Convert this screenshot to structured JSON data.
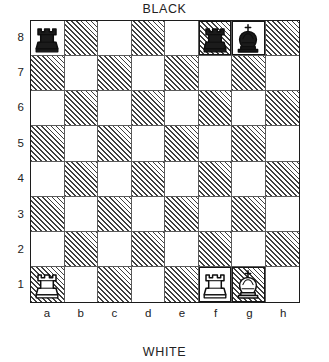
{
  "diagram": {
    "type": "chess-board-diagram",
    "top_label": "BLACK",
    "bottom_label": "WHITE",
    "files": [
      "a",
      "b",
      "c",
      "d",
      "e",
      "f",
      "g",
      "h"
    ],
    "ranks": [
      "8",
      "7",
      "6",
      "5",
      "4",
      "3",
      "2",
      "1"
    ],
    "colors": {
      "light_square": "#ffffff",
      "dark_square_hatch": "#3f3f3f",
      "border": "#1c1c1c",
      "text": "#222222"
    },
    "orientation": "white-at-bottom",
    "pieces": [
      {
        "square": "a8",
        "color": "black",
        "type": "rook",
        "glyph": "black-rook-icon",
        "highlight": false
      },
      {
        "square": "f8",
        "color": "black",
        "type": "rook",
        "glyph": "black-rook-icon",
        "highlight": true
      },
      {
        "square": "g8",
        "color": "black",
        "type": "king",
        "glyph": "black-king-icon",
        "highlight": true
      },
      {
        "square": "a1",
        "color": "white",
        "type": "rook",
        "glyph": "white-rook-icon",
        "highlight": false
      },
      {
        "square": "f1",
        "color": "white",
        "type": "rook",
        "glyph": "white-rook-icon",
        "highlight": true
      },
      {
        "square": "g1",
        "color": "white",
        "type": "king",
        "glyph": "white-king-icon",
        "highlight": true
      }
    ],
    "fen": "r4rk1/8/8/8/8/8/8/R4RK1"
  }
}
